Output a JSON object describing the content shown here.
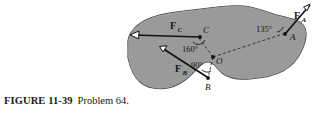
{
  "figure": {
    "caption_label": "FIGURE 11-39",
    "caption_text": "Problem 64.",
    "body_color": "#9a9a9a",
    "body_outline_color": "#3d3d3d",
    "line_color": "#111111",
    "background": "#ffffff"
  },
  "diagram": {
    "pivot": {
      "label": "O",
      "name": "point-o"
    },
    "points": [
      {
        "id": "A",
        "label": "A"
      },
      {
        "id": "B",
        "label": "B"
      },
      {
        "id": "C",
        "label": "C"
      }
    ],
    "forces": [
      {
        "id": "FA",
        "label": "F",
        "subscript": "A",
        "angle_label": "135°"
      },
      {
        "id": "FB",
        "label": "F",
        "subscript": "B",
        "angle_label": "90°"
      },
      {
        "id": "FC",
        "label": "F",
        "subscript": "C",
        "angle_label": "160°"
      }
    ],
    "angles": [
      {
        "id": "ang-a",
        "value": "135°",
        "vertex": "A"
      },
      {
        "id": "ang-c",
        "value": "160°",
        "vertex": "C"
      },
      {
        "id": "ang-b",
        "value": "90°",
        "vertex": "B"
      }
    ]
  }
}
